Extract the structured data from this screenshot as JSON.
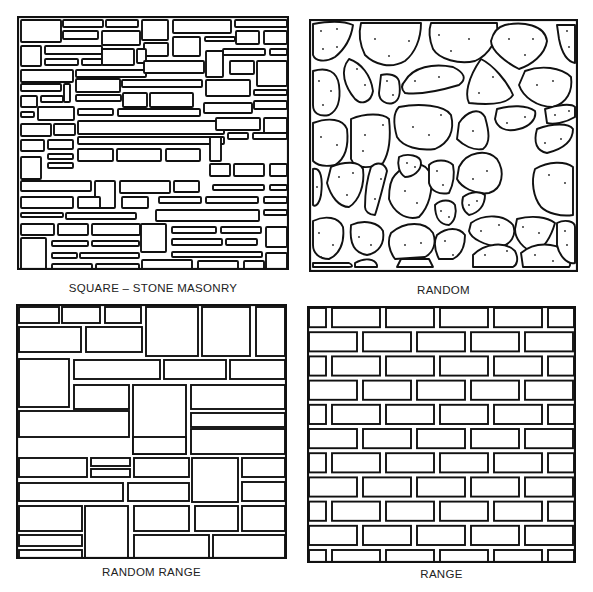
{
  "figure": {
    "panels": [
      {
        "id": "square-stone-masonry",
        "label": "SQUARE – STONE MASONRY"
      },
      {
        "id": "random",
        "label": "RANDOM"
      },
      {
        "id": "random-range",
        "label": "RANDOM RANGE"
      },
      {
        "id": "range",
        "label": "RANGE"
      }
    ]
  },
  "colors": {
    "line": "#111111",
    "background": "#ffffff"
  },
  "square_stones": [
    [
      3,
      3,
      40,
      22
    ],
    [
      45,
      3,
      40,
      7
    ],
    [
      88,
      3,
      32,
      7
    ],
    [
      124,
      3,
      26,
      20
    ],
    [
      155,
      3,
      58,
      13
    ],
    [
      217,
      3,
      52,
      7
    ],
    [
      45,
      14,
      35,
      8
    ],
    [
      84,
      14,
      38,
      14
    ],
    [
      218,
      14,
      23,
      13
    ],
    [
      246,
      14,
      23,
      13
    ],
    [
      3,
      29,
      20,
      20
    ],
    [
      27,
      29,
      57,
      8
    ],
    [
      126,
      26,
      24,
      13
    ],
    [
      155,
      20,
      27,
      19
    ],
    [
      187,
      20,
      30,
      4
    ],
    [
      205,
      32,
      42,
      6
    ],
    [
      252,
      32,
      17,
      6
    ],
    [
      27,
      42,
      33,
      6
    ],
    [
      64,
      42,
      20,
      6
    ],
    [
      84,
      32,
      32,
      16
    ],
    [
      119,
      32,
      9,
      14
    ],
    [
      188,
      34,
      17,
      26
    ],
    [
      212,
      44,
      24,
      13
    ],
    [
      3,
      53,
      52,
      12
    ],
    [
      58,
      53,
      70,
      7
    ],
    [
      126,
      44,
      60,
      12
    ],
    [
      239,
      44,
      30,
      25
    ],
    [
      3,
      67,
      40,
      7
    ],
    [
      46,
      67,
      6,
      18
    ],
    [
      58,
      62,
      44,
      13
    ],
    [
      104,
      63,
      80,
      7
    ],
    [
      188,
      63,
      44,
      16
    ],
    [
      3,
      79,
      16,
      11
    ],
    [
      23,
      79,
      22,
      6
    ],
    [
      58,
      78,
      45,
      6
    ],
    [
      105,
      76,
      24,
      14
    ],
    [
      132,
      76,
      43,
      14
    ],
    [
      236,
      73,
      33,
      5
    ],
    [
      3,
      95,
      13,
      5
    ],
    [
      20,
      90,
      36,
      13
    ],
    [
      60,
      92,
      35,
      6
    ],
    [
      100,
      92,
      82,
      7
    ],
    [
      186,
      86,
      48,
      10
    ],
    [
      236,
      84,
      33,
      8
    ],
    [
      3,
      107,
      30,
      12
    ],
    [
      36,
      107,
      21,
      11
    ],
    [
      60,
      104,
      146,
      13
    ],
    [
      198,
      101,
      44,
      12
    ],
    [
      246,
      101,
      23,
      15
    ],
    [
      3,
      123,
      23,
      11
    ],
    [
      30,
      123,
      25,
      9
    ],
    [
      60,
      120,
      146,
      7
    ],
    [
      192,
      120,
      11,
      24
    ],
    [
      210,
      116,
      20,
      6
    ],
    [
      235,
      116,
      34,
      6
    ],
    [
      3,
      140,
      20,
      22
    ],
    [
      30,
      137,
      25,
      5
    ],
    [
      60,
      132,
      35,
      12
    ],
    [
      99,
      132,
      44,
      12
    ],
    [
      148,
      132,
      34,
      12
    ],
    [
      30,
      146,
      25,
      5
    ],
    [
      192,
      147,
      20,
      12
    ],
    [
      216,
      147,
      30,
      12
    ],
    [
      252,
      147,
      17,
      12
    ],
    [
      3,
      164,
      70,
      10
    ],
    [
      77,
      164,
      20,
      27
    ],
    [
      102,
      164,
      50,
      12
    ],
    [
      156,
      164,
      25,
      11
    ],
    [
      195,
      168,
      51,
      5
    ],
    [
      252,
      168,
      17,
      5
    ],
    [
      3,
      180,
      52,
      11
    ],
    [
      60,
      180,
      22,
      11
    ],
    [
      104,
      180,
      26,
      11
    ],
    [
      141,
      180,
      42,
      6
    ],
    [
      188,
      180,
      52,
      6
    ],
    [
      246,
      180,
      23,
      6
    ],
    [
      3,
      196,
      42,
      4
    ],
    [
      48,
      196,
      70,
      6
    ],
    [
      138,
      193,
      103,
      11
    ],
    [
      246,
      193,
      23,
      5
    ],
    [
      3,
      207,
      33,
      11
    ],
    [
      40,
      207,
      30,
      11
    ],
    [
      74,
      207,
      48,
      11
    ],
    [
      123,
      207,
      25,
      28
    ],
    [
      154,
      210,
      44,
      6
    ],
    [
      203,
      210,
      40,
      6
    ],
    [
      3,
      221,
      25,
      32
    ],
    [
      34,
      224,
      36,
      5
    ],
    [
      74,
      224,
      47,
      5
    ],
    [
      154,
      222,
      50,
      6
    ],
    [
      208,
      222,
      31,
      6
    ],
    [
      248,
      210,
      21,
      20
    ],
    [
      34,
      236,
      25,
      5
    ],
    [
      62,
      236,
      59,
      5
    ],
    [
      154,
      235,
      90,
      5
    ],
    [
      248,
      236,
      21,
      16
    ],
    [
      34,
      247,
      40,
      6
    ],
    [
      78,
      247,
      43,
      6
    ],
    [
      124,
      243,
      50,
      10
    ],
    [
      180,
      244,
      40,
      9
    ],
    [
      226,
      244,
      20,
      9
    ],
    [
      248,
      255,
      21,
      6
    ]
  ],
  "random_stones": [
    {
      "d": "M4,5 C20,2 35,2 44,6 C42,20 36,30 26,38 C16,44 6,42 4,36 Z",
      "dots": [
        [
          12,
          12
        ],
        [
          28,
          10
        ],
        [
          14,
          30
        ],
        [
          28,
          28
        ]
      ]
    },
    {
      "d": "M52,4 L112,4 C112,20 106,34 96,42 C82,50 66,46 56,36 C50,24 50,12 52,4 Z",
      "dots": [
        [
          66,
          20
        ],
        [
          100,
          22
        ],
        [
          80,
          37
        ]
      ]
    },
    {
      "d": "M122,4 L188,4 C190,20 180,36 166,42 C150,46 130,40 124,30 C120,20 120,10 122,4 Z",
      "dots": [
        [
          130,
          16
        ],
        [
          160,
          20
        ],
        [
          142,
          32
        ]
      ]
    },
    {
      "d": "M196,6 C214,2 236,6 238,22 C236,36 222,46 210,50 C198,44 182,32 182,22 C184,14 188,8 196,6 Z",
      "dots": [
        [
          200,
          20
        ],
        [
          224,
          20
        ],
        [
          216,
          36
        ]
      ]
    },
    {
      "d": "M248,6 L266,6 L266,44 C256,42 252,30 250,20 Z",
      "dots": [
        [
          258,
          12
        ],
        [
          260,
          28
        ]
      ]
    },
    {
      "d": "M4,52 C18,48 28,52 30,66 C32,82 28,92 20,96 C10,98 4,94 4,86 Z",
      "dots": [
        [
          10,
          62
        ],
        [
          22,
          72
        ],
        [
          14,
          86
        ]
      ]
    },
    {
      "d": "M40,40 C52,44 62,56 64,72 C62,84 52,86 46,80 C36,68 30,52 40,40 Z",
      "dots": [
        [
          48,
          50
        ],
        [
          56,
          66
        ]
      ]
    },
    {
      "d": "M72,56 C80,54 88,56 90,62 C92,74 90,82 84,84 C78,86 70,82 70,74 Z",
      "dots": [
        [
          78,
          62
        ],
        [
          84,
          76
        ]
      ]
    },
    {
      "d": "M96,62 C104,48 124,44 144,48 C156,54 158,60 150,66 C130,72 110,76 96,74 C92,70 92,66 96,62 Z",
      "dots": [
        [
          106,
          62
        ],
        [
          130,
          58
        ]
      ]
    },
    {
      "d": "M172,40 C184,46 198,62 204,76 C198,86 178,86 160,84 C156,76 158,60 172,40 Z",
      "dots": [
        [
          184,
          58
        ],
        [
          170,
          74
        ]
      ]
    },
    {
      "d": "M216,52 C232,46 252,48 262,58 C264,72 258,84 244,88 C228,88 214,78 210,66 Z",
      "dots": [
        [
          228,
          66
        ],
        [
          244,
          62
        ]
      ]
    },
    {
      "d": "M4,104 C20,98 34,100 38,110 C40,128 36,140 26,146 C16,148 8,146 4,142 Z",
      "dots": [
        [
          12,
          118
        ],
        [
          28,
          126
        ]
      ]
    },
    {
      "d": "M90,88 C110,84 136,86 142,96 C146,112 140,124 126,130 C110,132 94,128 88,118 C84,104 84,94 90,88 Z",
      "dots": [
        [
          104,
          108
        ],
        [
          132,
          96
        ],
        [
          120,
          116
        ]
      ]
    },
    {
      "d": "M42,100 C56,94 74,94 80,100 C82,118 80,134 74,144 C60,150 46,150 42,140 Z",
      "dots": [
        [
          56,
          116
        ],
        [
          74,
          106
        ],
        [
          54,
          132
        ]
      ]
    },
    {
      "d": "M150,104 C158,92 170,88 176,98 C180,112 182,124 174,130 C164,132 154,126 148,120 Z",
      "dots": [
        [
          164,
          112
        ]
      ]
    },
    {
      "d": "M188,90 C202,86 218,86 226,92 C228,100 220,108 210,110 C196,114 188,108 186,100 Z",
      "dots": [
        [
          198,
          104
        ],
        [
          216,
          98
        ]
      ]
    },
    {
      "d": "M236,90 C248,86 262,84 266,88 L266,98 C256,104 244,106 238,104 Z",
      "dots": [
        [
          246,
          96
        ],
        [
          260,
          92
        ]
      ]
    },
    {
      "d": "M228,110 C244,104 260,104 264,110 C264,122 254,130 238,134 C228,132 224,124 228,110 Z",
      "dots": [
        [
          236,
          124
        ],
        [
          252,
          120
        ]
      ]
    },
    {
      "d": "M4,150 C12,148 14,160 12,176 C10,186 6,188 4,186 Z",
      "dots": [
        [
          8,
          168
        ]
      ]
    },
    {
      "d": "M22,148 C36,142 50,142 54,150 C56,166 50,182 40,188 C30,188 22,178 18,164 Z",
      "dots": [
        [
          30,
          158
        ],
        [
          44,
          154
        ],
        [
          38,
          176
        ]
      ]
    },
    {
      "d": "M62,148 C68,142 76,144 78,152 C74,168 70,184 66,196 C60,196 56,192 56,188 C56,176 58,160 62,148 Z",
      "dots": [
        [
          72,
          160
        ],
        [
          66,
          180
        ]
      ]
    },
    {
      "d": "M86,156 C100,140 116,142 122,156 C124,172 120,188 110,198 C96,202 84,192 80,180 C80,170 82,160 86,156 Z",
      "dots": [
        [
          96,
          172
        ],
        [
          108,
          184
        ],
        [
          90,
          194
        ]
      ]
    },
    {
      "d": "M90,138 C98,134 112,136 112,144 C112,152 104,158 96,158 C90,154 88,146 90,138 Z",
      "dots": [
        [
          98,
          144
        ],
        [
          106,
          148
        ]
      ]
    },
    {
      "d": "M120,146 C126,140 138,140 144,146 C146,156 144,166 140,174 C130,176 122,172 120,164 Z",
      "dots": [
        [
          128,
          152
        ],
        [
          134,
          166
        ]
      ]
    },
    {
      "d": "M150,148 C158,132 178,130 188,140 C196,152 194,170 180,174 C166,176 152,168 148,160 Z",
      "dots": [
        [
          164,
          160
        ],
        [
          178,
          152
        ]
      ]
    },
    {
      "d": "M154,178 C162,172 172,172 176,176 C176,186 170,194 160,196 C154,192 152,186 154,178 Z",
      "dots": [
        [
          160,
          186
        ],
        [
          168,
          182
        ]
      ]
    },
    {
      "d": "M226,150 C240,142 256,142 264,148 L264,196 C252,198 238,194 232,188 C224,178 222,162 226,150 Z",
      "dots": [
        [
          240,
          156
        ],
        [
          256,
          164
        ]
      ]
    },
    {
      "d": "M126,186 C132,180 142,180 146,186 C148,194 146,202 140,206 C132,206 126,200 126,186 Z",
      "dots": [
        [
          132,
          192
        ],
        [
          140,
          198
        ]
      ]
    },
    {
      "d": "M162,204 C176,194 196,196 204,206 C208,216 202,226 190,228 C176,226 162,220 160,212 Z",
      "dots": [
        [
          172,
          212
        ],
        [
          190,
          206
        ],
        [
          198,
          226
        ]
      ]
    },
    {
      "d": "M208,200 C224,196 238,198 246,204 C242,218 236,228 226,234 C214,230 206,220 206,210 Z",
      "dots": [
        [
          214,
          208
        ],
        [
          230,
          214
        ]
      ]
    },
    {
      "d": "M4,202 C16,196 30,198 34,208 C36,224 30,236 20,240 C10,240 4,234 4,226 Z",
      "dots": [
        [
          10,
          214
        ],
        [
          24,
          226
        ],
        [
          12,
          238
        ]
      ]
    },
    {
      "d": "M42,206 C56,200 70,204 74,212 C76,224 70,234 58,236 C46,234 40,226 42,206 Z",
      "dots": [
        [
          50,
          218
        ],
        [
          62,
          226
        ]
      ]
    },
    {
      "d": "M82,214 C96,202 116,202 124,214 C128,224 124,234 116,238 L86,240 C80,232 78,222 82,214 Z",
      "dots": [
        [
          96,
          226
        ],
        [
          112,
          224
        ]
      ]
    },
    {
      "d": "M128,216 C138,208 150,208 156,216 C156,228 152,236 144,240 L130,240 C126,232 124,224 128,216 Z",
      "dots": [
        [
          136,
          222
        ],
        [
          144,
          236
        ]
      ]
    },
    {
      "d": "M164,236 C176,224 196,222 206,232 C210,240 208,246 204,248 L164,248 Z",
      "dots": [
        [
          176,
          236
        ],
        [
          198,
          232
        ]
      ]
    },
    {
      "d": "M212,234 C226,222 246,224 256,232 C262,240 262,246 260,248 L214,248 Z",
      "dots": [
        [
          226,
          236
        ],
        [
          244,
          242
        ]
      ]
    },
    {
      "d": "M248,204 C256,200 266,202 266,208 L266,244 C258,246 250,236 248,226 Z",
      "dots": [
        [
          256,
          212
        ],
        [
          258,
          226
        ]
      ]
    },
    {
      "d": "M4,244 L40,244 C44,246 44,248 40,248 L4,248 Z",
      "dots": []
    },
    {
      "d": "M46,244 C56,238 66,240 68,246 L68,248 L46,248 Z",
      "dots": []
    },
    {
      "d": "M92,240 L120,240 L124,248 L88,248 Z",
      "dots": []
    }
  ],
  "random_range_stones": [
    [
      2,
      2,
      40,
      16
    ],
    [
      45,
      2,
      38,
      16
    ],
    [
      88,
      2,
      36,
      16
    ],
    [
      129,
      2,
      52,
      49
    ],
    [
      185,
      2,
      48,
      49
    ],
    [
      239,
      2,
      29,
      49
    ],
    [
      2,
      22,
      62,
      25
    ],
    [
      69,
      22,
      56,
      25
    ],
    [
      2,
      54,
      50,
      48
    ],
    [
      57,
      55,
      86,
      19
    ],
    [
      147,
      55,
      62,
      19
    ],
    [
      213,
      55,
      55,
      19
    ],
    [
      57,
      80,
      55,
      24
    ],
    [
      116,
      80,
      53,
      69
    ],
    [
      174,
      80,
      94,
      24
    ],
    [
      2,
      106,
      110,
      26
    ],
    [
      174,
      108,
      94,
      14
    ],
    [
      116,
      150,
      53,
      0
    ],
    [
      2,
      132,
      110,
      0
    ],
    [
      116,
      132,
      53,
      17
    ],
    [
      174,
      124,
      94,
      25
    ],
    [
      2,
      153,
      68,
      19
    ],
    [
      74,
      153,
      39,
      8
    ],
    [
      74,
      164,
      39,
      8
    ],
    [
      117,
      153,
      55,
      19
    ],
    [
      175,
      153,
      46,
      44
    ],
    [
      225,
      153,
      43,
      19
    ],
    [
      2,
      178,
      104,
      18
    ],
    [
      111,
      178,
      61,
      18
    ],
    [
      225,
      177,
      43,
      19
    ],
    [
      2,
      201,
      63,
      25
    ],
    [
      68,
      201,
      43,
      60
    ],
    [
      117,
      201,
      55,
      25
    ],
    [
      178,
      201,
      43,
      25
    ],
    [
      225,
      201,
      43,
      25
    ],
    [
      2,
      230,
      63,
      11
    ],
    [
      2,
      245,
      63,
      16
    ],
    [
      117,
      230,
      75,
      31
    ],
    [
      196,
      230,
      72,
      31
    ]
  ],
  "range_rows": {
    "rows": 11,
    "row_height": 24.2,
    "gap": 4,
    "long": 48,
    "odd_offset": -32,
    "odd_first": 20
  }
}
